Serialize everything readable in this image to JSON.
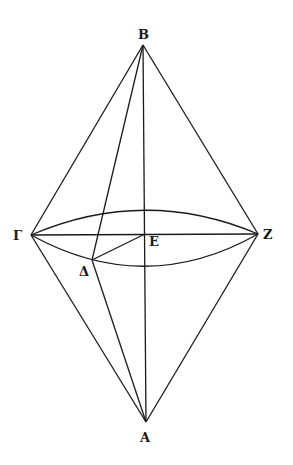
{
  "figure": {
    "type": "geometric-construction",
    "points": {
      "B": {
        "label": "B",
        "x": 143,
        "y": 45
      },
      "A": {
        "label": "A",
        "x": 146,
        "y": 422
      },
      "Gamma": {
        "label": "Γ",
        "x": 31,
        "y": 235
      },
      "Z": {
        "label": "Z",
        "x": 258,
        "y": 234
      },
      "E": {
        "label": "E",
        "x": 145,
        "y": 234
      },
      "Delta": {
        "label": "Δ",
        "x": 92,
        "y": 260
      }
    },
    "segments": [
      [
        "B",
        "Gamma"
      ],
      [
        "B",
        "Z"
      ],
      [
        "B",
        "A"
      ],
      [
        "B",
        "Delta"
      ],
      [
        "A",
        "Gamma"
      ],
      [
        "A",
        "Z"
      ],
      [
        "A",
        "Delta"
      ],
      [
        "Gamma",
        "Z"
      ],
      [
        "Delta",
        "E"
      ]
    ],
    "ellipse": {
      "center": "E",
      "upper_y": 210,
      "lower_y": 267
    },
    "stroke_color": "#1a1a1a"
  }
}
